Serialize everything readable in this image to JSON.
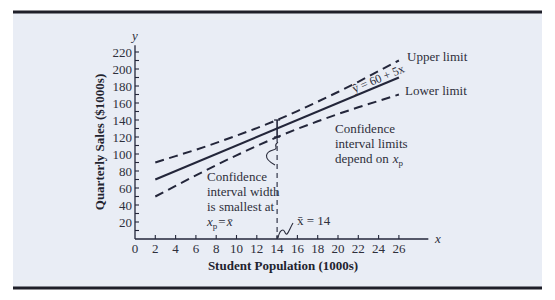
{
  "chart_data": {
    "type": "line",
    "title": "",
    "xlabel": "Student Population (1000s)",
    "ylabel": "Quarterly Sales ($1000s)",
    "x_axis_symbol": "x",
    "y_axis_symbol": "y",
    "xlim": [
      0,
      26
    ],
    "ylim": [
      0,
      220
    ],
    "grid": false,
    "x_ticks": [
      "0",
      "2",
      "4",
      "6",
      "8",
      "10",
      "12",
      "14",
      "16",
      "18",
      "20",
      "22",
      "24",
      "26"
    ],
    "y_ticks": [
      "20",
      "40",
      "60",
      "80",
      "100",
      "120",
      "140",
      "160",
      "180",
      "200",
      "220"
    ],
    "y_minor_step": 10,
    "series": [
      {
        "name": "Estimated regression line",
        "style": "solid",
        "x": [
          2,
          26
        ],
        "y": [
          70,
          190
        ]
      },
      {
        "name": "Upper limit",
        "style": "dashed",
        "x": [
          2,
          4,
          6,
          8,
          10,
          12,
          14,
          16,
          18,
          20,
          22,
          24,
          26
        ],
        "y": [
          90,
          97.5,
          105,
          113,
          121.5,
          130.5,
          140,
          150.5,
          161.5,
          173,
          185,
          197.5,
          210
        ]
      },
      {
        "name": "Lower limit",
        "style": "dashed",
        "x": [
          2,
          4,
          6,
          8,
          10,
          12,
          14,
          16,
          18,
          20,
          22,
          24,
          26
        ],
        "y": [
          50,
          62.5,
          75,
          87,
          98.5,
          109.5,
          120,
          129.5,
          138.5,
          147,
          155,
          162.5,
          170
        ]
      }
    ],
    "xbar": 14,
    "interval_at_xbar": {
      "x": 14,
      "lower": 120,
      "upper": 140
    },
    "annotations": {
      "equation": "ŷ = 60 + 5x",
      "upper_limit": "Upper limit",
      "lower_limit": "Lower limit",
      "limits_note": {
        "line1": "Confidence",
        "line2": "interval limits",
        "line3": "depend on",
        "var": "x",
        "sub": "p"
      },
      "width_note": {
        "line1": "Confidence",
        "line2": "interval width",
        "line3": "is smallest at",
        "var": "x",
        "sub": "p",
        "eq": "=",
        "xbar": "x̄"
      },
      "xbar_label": "x̄ = 14"
    }
  }
}
